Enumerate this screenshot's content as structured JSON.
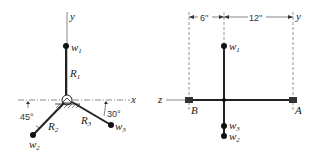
{
  "left_figure": {
    "axes": {
      "y_label": "y",
      "x_label": "x"
    },
    "masses": [
      {
        "name": "w",
        "sub": "1"
      },
      {
        "name": "w",
        "sub": "2"
      },
      {
        "name": "w",
        "sub": "3"
      }
    ],
    "arms": [
      {
        "name": "R",
        "sub": "1"
      },
      {
        "name": "R",
        "sub": "2"
      },
      {
        "name": "R",
        "sub": "3"
      }
    ],
    "angles": {
      "left": "45°",
      "right": "30°"
    }
  },
  "right_figure": {
    "axes": {
      "y_label": "y",
      "z_label": "z"
    },
    "dimensions": {
      "left": "6''",
      "right": "12''"
    },
    "bearings": {
      "left": "B",
      "right": "A"
    },
    "masses": [
      {
        "name": "w",
        "sub": "1"
      },
      {
        "name": "w",
        "sub": "3"
      },
      {
        "name": "w",
        "sub": "2"
      }
    ]
  }
}
